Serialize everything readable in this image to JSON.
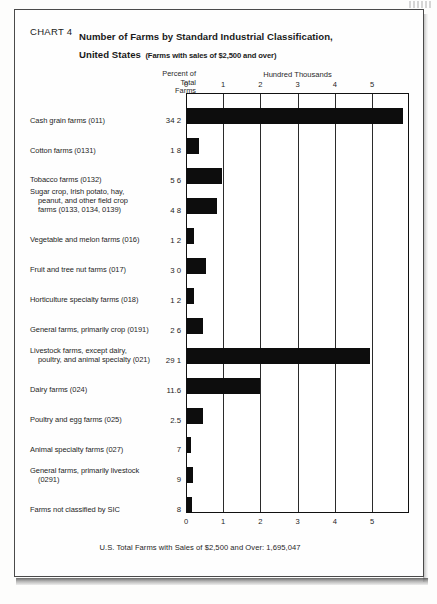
{
  "document": {
    "chart_number": "CHART 4",
    "title_line_1": "Number of Farms by Standard Industrial Classification,",
    "title_line_2": "United States",
    "subtitle": "(Farms with sales of $2,500 and over)",
    "footer": "U.S. Total Farms with Sales of $2,500 and Over: 1,695,047"
  },
  "axis_header": {
    "percent_line_1": "Percent of",
    "percent_line_2": "Total",
    "percent_line_3": "Farms",
    "units_label": "Hundred Thousands"
  },
  "chart_data": {
    "type": "bar",
    "orientation": "horizontal",
    "title": "CHART 4 Number of Farms by Standard Industrial Classification, United States",
    "subtitle": "(Farms with sales of $2,500 and over)",
    "xlabel": "Hundred Thousands",
    "ylabel": "",
    "value_column_header": "Percent of Total Farms",
    "xlim": [
      0,
      6
    ],
    "xticks": [
      0,
      1,
      2,
      3,
      4,
      5
    ],
    "xtick_labels": [
      "0",
      "1",
      "2",
      "3",
      "4",
      "5"
    ],
    "grid": true,
    "legend": null,
    "note": "Bar lengths are in hundred thousands of farms; data labels show percent of total farms.",
    "categories": [
      "Cash grain farms (011)",
      "Cotton farms (0131)",
      "Tobacco farms (0132)",
      "Sugar crop, Irish potato, hay, peanut, and other field crop farms (0133, 0134, 0139)",
      "Vegetable and melon farms (016)",
      "Fruit and tree nut farms (017)",
      "Horticulture specialty farms (018)",
      "General farms, primarily crop (0191)",
      "Livestock farms, except dairy, poultry, and animal specialty (021)",
      "Dairy farms (024)",
      "Poultry and egg farms (025)",
      "Animal specialty farms (027)",
      "General farms, primarily livestock (0291)",
      "Farms not classified by SIC"
    ],
    "percent_labels": [
      "34 2",
      "1 8",
      "5 6",
      "4 8",
      "1 2",
      "3 0",
      "1 2",
      "2 6",
      "29 1",
      "11.6",
      "2.5",
      ".7",
      ".9",
      ".8"
    ],
    "percent_values": [
      34.2,
      1.8,
      5.6,
      4.8,
      1.2,
      3.0,
      1.2,
      2.6,
      29.1,
      11.6,
      2.5,
      0.7,
      0.9,
      0.8
    ],
    "values": [
      5.8,
      0.31,
      0.95,
      0.81,
      0.2,
      0.51,
      0.2,
      0.44,
      4.93,
      1.97,
      0.42,
      0.12,
      0.15,
      0.14
    ]
  },
  "rows": [
    {
      "label_main": "Cash grain farms (011)",
      "label_cont_1": "",
      "label_cont_2": "",
      "pct": "34 2",
      "bar_value": 5.8
    },
    {
      "label_main": "Cotton farms (0131)",
      "label_cont_1": "",
      "label_cont_2": "",
      "pct": "1 8",
      "bar_value": 0.31
    },
    {
      "label_main": "Tobacco farms (0132)",
      "label_cont_1": "",
      "label_cont_2": "",
      "pct": "5 6",
      "bar_value": 0.95
    },
    {
      "label_main": "Sugar crop, Irish potato, hay,",
      "label_cont_1": "peanut, and other field crop",
      "label_cont_2": "farms (0133, 0134, 0139)",
      "pct": "4 8",
      "bar_value": 0.81
    },
    {
      "label_main": "Vegetable and melon farms (016)",
      "label_cont_1": "",
      "label_cont_2": "",
      "pct": "1 2",
      "bar_value": 0.2
    },
    {
      "label_main": "Fruit and tree nut farms (017)",
      "label_cont_1": "",
      "label_cont_2": "",
      "pct": "3 0",
      "bar_value": 0.51
    },
    {
      "label_main": "Horticulture specialty farms (018)",
      "label_cont_1": "",
      "label_cont_2": "",
      "pct": "1 2",
      "bar_value": 0.2
    },
    {
      "label_main": "General farms, primarily crop (0191)",
      "label_cont_1": "",
      "label_cont_2": "",
      "pct": "2 6",
      "bar_value": 0.44
    },
    {
      "label_main": "Livestock farms, except dairy,",
      "label_cont_1": "poultry, and animal specialty (021)",
      "label_cont_2": "",
      "pct": "29 1",
      "bar_value": 4.93
    },
    {
      "label_main": "Dairy farms (024)",
      "label_cont_1": "",
      "label_cont_2": "",
      "pct": "11.6",
      "bar_value": 1.97
    },
    {
      "label_main": "Poultry and egg farms (025)",
      "label_cont_1": "",
      "label_cont_2": "",
      "pct": "2.5",
      "bar_value": 0.42
    },
    {
      "label_main": "Animal specialty farms (027)",
      "label_cont_1": "",
      "label_cont_2": "",
      "pct": "7",
      "bar_value": 0.12
    },
    {
      "label_main": "General farms, primarily livestock",
      "label_cont_1": "(0291)",
      "label_cont_2": "",
      "pct": "9",
      "bar_value": 0.15
    },
    {
      "label_main": "Farms not classified by SIC",
      "label_cont_1": "",
      "label_cont_2": "",
      "pct": "8",
      "bar_value": 0.14
    }
  ]
}
